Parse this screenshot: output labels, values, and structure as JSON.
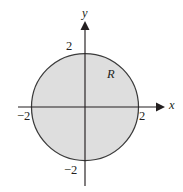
{
  "figure": {
    "name": "disk-region-diagram",
    "width": 183,
    "height": 192,
    "background_color": "#ffffff"
  },
  "axes": {
    "x_label": "x",
    "y_label": "y",
    "origin_px": {
      "x": 85,
      "y": 107
    },
    "x_axis_px": {
      "start_x": 18,
      "end_x": 163,
      "y": 107
    },
    "y_axis_px": {
      "x": 85,
      "start_y": 22,
      "end_y": 186
    },
    "arrow_color": "#231f20",
    "line_color": "#231f20"
  },
  "ticks": {
    "y_positive": "2",
    "y_negative": "−2",
    "x_positive": "2",
    "x_negative": "−2"
  },
  "region": {
    "label": "R",
    "fill_color": "#dedede",
    "stroke_color": "#3b3b3b"
  },
  "chart_data": {
    "type": "scatter",
    "title": "",
    "subtitle": "",
    "xlabel": "x",
    "ylabel": "y",
    "xlim": [
      -2.6,
      2.9
    ],
    "ylim": [
      -2.6,
      2.7
    ],
    "xticks": [
      -2,
      2
    ],
    "yticks": [
      -2,
      2
    ],
    "xticklabels": [
      "−2",
      "2"
    ],
    "yticklabels": [
      "−2",
      "2"
    ],
    "grid": false,
    "legend": false,
    "legend_position": "none",
    "shapes": [
      {
        "kind": "circle",
        "label": "R",
        "center": [
          0,
          0
        ],
        "radius": 2,
        "equation": "x^2 + y^2 ≤ 4",
        "filled": true,
        "fill_color": "#dedede",
        "edge_color": "#3b3b3b",
        "label_position": [
          0.95,
          1.25
        ]
      }
    ],
    "annotations": [
      {
        "text": "R",
        "x": 0.95,
        "y": 1.25,
        "style": "italic"
      }
    ]
  }
}
